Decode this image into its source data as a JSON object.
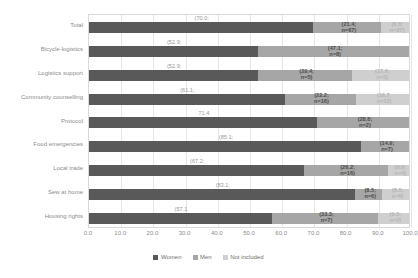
{
  "chart_data": {
    "type": "bar",
    "subtype": "stacked-horizontal-100",
    "title": "",
    "xlabel": "",
    "ylabel": "",
    "xlim": [
      0,
      100
    ],
    "xticks": [
      "0.0",
      "10.0",
      "20.0",
      "30.0",
      "40.0",
      "50.0",
      "60.0",
      "70.0",
      "80.0",
      "90.0",
      "100.0"
    ],
    "grid": true,
    "legend_position": "bottom",
    "categories": [
      "Total",
      "Bicycle-logistics",
      "Logistics support",
      "Community counselling",
      "Protocol",
      "Food emergencies",
      "Local trade",
      "Sew at home",
      "Housing rights"
    ],
    "series": [
      {
        "name": "Women",
        "color": "#595959",
        "values": [
          70.0,
          52.9,
          52.9,
          61.1,
          71.4,
          85.1,
          67.2,
          83.1,
          57.1
        ]
      },
      {
        "name": "Men",
        "color": "#a6a6a6",
        "values": [
          21.4,
          47.1,
          29.4,
          22.2,
          28.6,
          14.9,
          26.2,
          8.5,
          33.3
        ]
      },
      {
        "name": "Not included",
        "color": "#cfcfcf",
        "values": [
          8.6,
          0,
          17.6,
          16.7,
          0,
          0,
          6.6,
          8.5,
          9.5
        ]
      }
    ],
    "data_labels": [
      {
        "category": "Total",
        "women": {
          "pct": "(70.0;",
          "n": ""
        },
        "men": {
          "pct": "(21.4;",
          "n": "n=67)"
        },
        "not": {
          "pct": "(8.6;",
          "n": "n=27)"
        }
      },
      {
        "category": "Bicycle-logistics",
        "women": {
          "pct": "(52.9;",
          "n": ""
        },
        "men": {
          "pct": "(47.1;",
          "n": "n=8)"
        },
        "not": {
          "pct": "",
          "n": ""
        }
      },
      {
        "category": "Logistics support",
        "women": {
          "pct": "(52.9;",
          "n": ""
        },
        "men": {
          "pct": "(29.4;",
          "n": "n=5)"
        },
        "not": {
          "pct": "(17.6;",
          "n": "n=3)"
        }
      },
      {
        "category": "Community counselling",
        "women": {
          "pct": "(61.1;",
          "n": ""
        },
        "men": {
          "pct": "(22.2;",
          "n": "n=16)"
        },
        "not": {
          "pct": "(16.7;",
          "n": "n=12)"
        }
      },
      {
        "category": "Protocol",
        "women": {
          "pct": "71.4",
          "n": ""
        },
        "men": {
          "pct": "(28.6;",
          "n": "n=2)"
        },
        "not": {
          "pct": "",
          "n": ""
        }
      },
      {
        "category": "Food emergencies",
        "women": {
          "pct": "(85.1;",
          "n": ""
        },
        "men": {
          "pct": "(14.9;",
          "n": "n=7)"
        },
        "not": {
          "pct": "",
          "n": ""
        }
      },
      {
        "category": "Local trade",
        "women": {
          "pct": "(67.2;",
          "n": ""
        },
        "men": {
          "pct": "(26.2;",
          "n": "n=16)"
        },
        "not": {
          "pct": "(6.6;",
          "n": "n=4)"
        }
      },
      {
        "category": "Sew at home",
        "women": {
          "pct": "(83.1;",
          "n": ""
        },
        "men": {
          "pct": "(8.5;",
          "n": "n=6)"
        },
        "not": {
          "pct": "(8.5;",
          "n": "n=6)"
        }
      },
      {
        "category": "Housing rights",
        "women": {
          "pct": "(57.1",
          "n": ""
        },
        "men": {
          "pct": "(33.3;",
          "n": "n=7)"
        },
        "not": {
          "pct": "(9.5;",
          "n": "n=2)"
        }
      }
    ]
  },
  "legend": {
    "items": [
      {
        "label": "Women"
      },
      {
        "label": "Men"
      },
      {
        "label": "Not included"
      }
    ]
  }
}
